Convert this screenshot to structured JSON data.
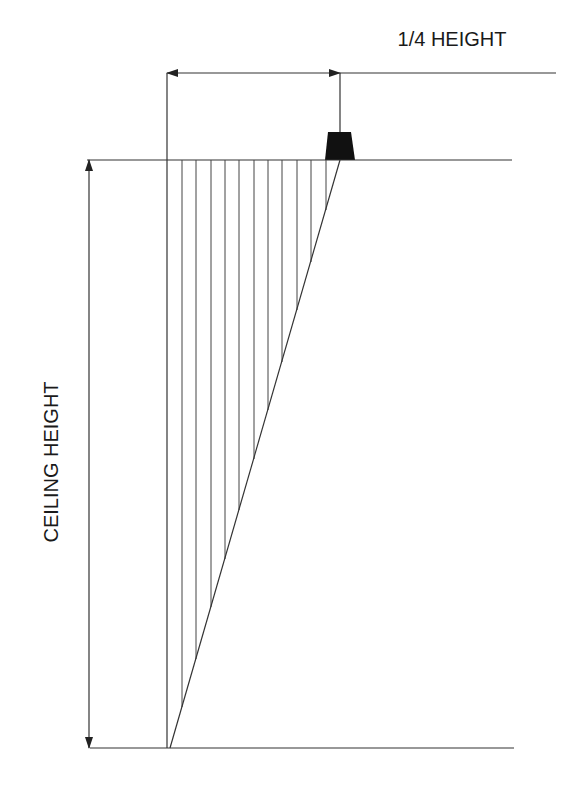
{
  "diagram": {
    "labels": {
      "top_dimension": "1/4 HEIGHT",
      "side_dimension": "CEILING HEIGHT"
    },
    "colors": {
      "line": "#333333",
      "text": "#1a1a1a",
      "fixture": "#111111",
      "background": "#ffffff"
    },
    "geometry": {
      "ceiling_y": 160,
      "floor_y": 748,
      "wall_x": 167,
      "fixture_x": 340,
      "hatch_x": [
        167,
        182,
        196,
        211,
        225,
        239,
        254,
        268,
        282,
        297,
        311,
        326
      ]
    }
  }
}
